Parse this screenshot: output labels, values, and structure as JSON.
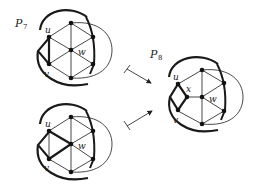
{
  "figure": {
    "graphs": [
      {
        "id": "P7-top",
        "title": "P",
        "title_sub": "7",
        "labels": {
          "u": "u",
          "v": "v",
          "w": "w"
        }
      },
      {
        "id": "P7-bottom",
        "labels": {
          "u": "u",
          "v": "v",
          "w": "w"
        }
      },
      {
        "id": "P8",
        "title": "P",
        "title_sub": "8",
        "labels": {
          "u": "u",
          "v": "v",
          "w": "w",
          "x": "x"
        }
      }
    ],
    "arrows": [
      {
        "from": "P7-top",
        "to": "P8",
        "style": "maps-to"
      },
      {
        "from": "P7-bottom",
        "to": "P8",
        "style": "maps-to"
      }
    ],
    "colors": {
      "stroke": "#1a1a1a",
      "background": "#ffffff"
    }
  }
}
